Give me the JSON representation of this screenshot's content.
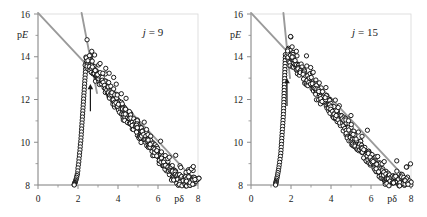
{
  "figure": {
    "title": "",
    "panels": [
      {
        "id": "left",
        "tag_var": "j",
        "tag_eq": "=",
        "tag_val": "9",
        "tag_full": "j = 9"
      },
      {
        "id": "right",
        "tag_var": "j",
        "tag_eq": "=",
        "tag_val": "15",
        "tag_full": "j = 15"
      }
    ]
  },
  "axes": {
    "x_label_p": "p",
    "x_label_sym": "δ",
    "y_label_p": "p",
    "y_label_sym": "E",
    "x_ticks": [
      "0",
      "2",
      "4",
      "6",
      "8"
    ],
    "y_ticks": [
      "8",
      "10",
      "12",
      "14",
      "16"
    ],
    "x_minor_count": 1,
    "y_minor_count": 1
  },
  "style": {
    "marker_edge": "#111111",
    "marker_face": "#ffffff",
    "line_color": "#9a9a9a",
    "axis_color": "#8c8c8c",
    "arrow_color": "#1a1a1a",
    "text_color": "#1a1a1a"
  },
  "chart_data": [
    {
      "type": "scatter",
      "panel": "left",
      "title": "j = 9",
      "xlabel": "pδ",
      "ylabel": "pE",
      "xlim": [
        0,
        8
      ],
      "ylim": [
        8,
        16
      ],
      "xticks": [
        0,
        2,
        4,
        6,
        8
      ],
      "yticks": [
        8,
        10,
        12,
        14,
        16
      ],
      "grid": false,
      "legend": false,
      "marker": "open-circle",
      "annotations": [
        {
          "kind": "text",
          "text": "j = 9",
          "x": 5.75,
          "y": 14.95
        },
        {
          "kind": "arrow",
          "x": 2.62,
          "y_tail": 11.45,
          "y_head": 12.72,
          "direction": "up"
        }
      ],
      "lines": [
        {
          "name": "shallow-guide",
          "x": [
            0.0,
            8.0
          ],
          "y": [
            16.05,
            8.05
          ]
        },
        {
          "name": "steep-guide",
          "x": [
            2.18,
            2.95
          ],
          "y": [
            16.05,
            12.3
          ]
        }
      ],
      "series": [
        {
          "name": "vertical-branch",
          "x": [
            2.4,
            2.39,
            2.38,
            2.37,
            2.36,
            2.35,
            2.34,
            2.33,
            2.32,
            2.31,
            2.3,
            2.29,
            2.28,
            2.27,
            2.26,
            2.25,
            2.24,
            2.23,
            2.22,
            2.21,
            2.2,
            2.19,
            2.18,
            2.17,
            2.16,
            2.15,
            2.14,
            2.12,
            2.11,
            2.1,
            2.08,
            2.07,
            2.05,
            2.04,
            2.02,
            2.0,
            1.99,
            1.97,
            1.95,
            1.93,
            1.91,
            1.89,
            1.87,
            1.85,
            1.84,
            1.83,
            1.82,
            1.81,
            1.81
          ],
          "y": [
            13.7,
            13.56,
            13.42,
            13.28,
            13.14,
            13.0,
            12.86,
            12.72,
            12.58,
            12.44,
            12.3,
            12.16,
            12.02,
            11.88,
            11.74,
            11.6,
            11.46,
            11.32,
            11.18,
            11.04,
            10.9,
            10.76,
            10.62,
            10.48,
            10.34,
            10.2,
            10.06,
            9.92,
            9.78,
            9.64,
            9.5,
            9.36,
            9.22,
            9.08,
            8.94,
            8.8,
            8.66,
            8.52,
            8.44,
            8.36,
            8.28,
            8.22,
            8.16,
            8.12,
            8.09,
            8.06,
            8.04,
            8.02,
            8.0
          ]
        },
        {
          "name": "diagonal-band",
          "x": [
            2.45,
            2.5,
            2.55,
            2.58,
            2.62,
            2.66,
            2.7,
            2.74,
            2.78,
            2.82,
            2.86,
            2.9,
            2.95,
            3.0,
            3.05,
            3.1,
            3.15,
            3.2,
            3.25,
            3.3,
            3.35,
            3.4,
            3.45,
            3.5,
            3.55,
            3.6,
            3.65,
            3.7,
            3.75,
            3.8,
            3.85,
            3.9,
            3.95,
            4.0,
            4.05,
            4.1,
            4.15,
            4.2,
            4.25,
            4.3,
            4.35,
            4.4,
            4.45,
            4.5,
            4.55,
            4.6,
            4.65,
            4.7,
            4.75,
            4.8,
            4.85,
            4.9,
            4.95,
            5.0,
            5.05,
            5.1,
            5.15,
            5.2,
            5.25,
            5.3,
            5.35,
            5.4,
            5.45,
            5.5,
            5.55,
            5.6,
            5.65,
            5.7,
            5.75,
            5.8,
            5.85,
            5.9,
            5.95,
            6.0,
            6.05,
            6.1,
            6.15,
            6.2,
            6.25,
            6.3,
            6.35,
            6.4,
            6.45,
            6.5,
            6.55,
            6.6,
            6.65,
            6.7,
            6.75,
            6.8,
            6.85,
            6.9,
            6.95,
            7.0,
            7.05,
            7.1,
            7.15,
            7.2,
            7.25,
            7.3,
            7.35,
            7.4,
            7.45,
            7.5,
            7.55,
            7.6,
            7.65,
            7.7,
            7.75,
            7.8,
            7.85,
            7.9,
            7.95
          ],
          "y": [
            13.72,
            13.64,
            13.58,
            13.52,
            13.46,
            13.4,
            13.34,
            13.28,
            13.22,
            13.16,
            13.1,
            13.04,
            12.98,
            12.92,
            12.86,
            12.8,
            12.74,
            12.68,
            12.62,
            12.56,
            12.5,
            12.44,
            12.38,
            12.32,
            12.26,
            12.2,
            12.14,
            12.08,
            12.02,
            11.96,
            11.9,
            11.84,
            11.78,
            11.72,
            11.66,
            11.6,
            11.54,
            11.48,
            11.42,
            11.36,
            11.3,
            11.24,
            11.18,
            11.12,
            11.06,
            11.0,
            10.94,
            10.88,
            10.82,
            10.76,
            10.7,
            10.64,
            10.58,
            10.52,
            10.46,
            10.4,
            10.34,
            10.28,
            10.22,
            10.16,
            10.1,
            10.04,
            9.98,
            9.92,
            9.86,
            9.8,
            9.74,
            9.68,
            9.62,
            9.56,
            9.5,
            9.44,
            9.38,
            9.32,
            9.26,
            9.2,
            9.14,
            9.08,
            9.02,
            8.96,
            8.9,
            8.84,
            8.78,
            8.72,
            8.66,
            8.6,
            8.54,
            8.48,
            8.42,
            8.36,
            8.3,
            8.26,
            8.22,
            8.18,
            8.14,
            8.12,
            8.1,
            8.08,
            8.06,
            8.05,
            8.04,
            8.04,
            8.03,
            8.03,
            8.02,
            8.02,
            8.02,
            8.01,
            8.01,
            8.01,
            8.0,
            8.0,
            8.0
          ]
        }
      ]
    },
    {
      "type": "scatter",
      "panel": "right",
      "title": "j = 15",
      "xlabel": "pδ",
      "ylabel": "pE",
      "xlim": [
        0,
        8
      ],
      "ylim": [
        8,
        16
      ],
      "xticks": [
        0,
        2,
        4,
        6,
        8
      ],
      "yticks": [
        8,
        10,
        12,
        14,
        16
      ],
      "grid": false,
      "legend": false,
      "marker": "open-circle",
      "annotations": [
        {
          "kind": "text",
          "text": "j = 15",
          "x": 5.7,
          "y": 14.95
        },
        {
          "kind": "arrow",
          "x": 1.8,
          "y_tail": 11.7,
          "y_head": 13.0,
          "direction": "up"
        }
      ],
      "lines": [
        {
          "name": "shallow-guide",
          "x": [
            0.0,
            8.0
          ],
          "y": [
            16.05,
            8.05
          ]
        },
        {
          "name": "steep-guide",
          "x": [
            1.62,
            1.95
          ],
          "y": [
            16.05,
            13.0
          ]
        }
      ],
      "series": [
        {
          "name": "vertical-branch",
          "x": [
            1.72,
            1.715,
            1.71,
            1.705,
            1.7,
            1.695,
            1.69,
            1.685,
            1.68,
            1.675,
            1.67,
            1.665,
            1.66,
            1.655,
            1.65,
            1.645,
            1.64,
            1.635,
            1.63,
            1.625,
            1.62,
            1.61,
            1.6,
            1.59,
            1.58,
            1.57,
            1.56,
            1.55,
            1.54,
            1.53,
            1.52,
            1.51,
            1.5,
            1.49,
            1.47,
            1.45,
            1.43,
            1.41,
            1.39,
            1.37,
            1.35,
            1.33,
            1.31,
            1.29,
            1.27,
            1.26,
            1.25,
            1.24,
            1.235,
            1.23
          ],
          "y": [
            14.1,
            13.96,
            13.82,
            13.68,
            13.54,
            13.4,
            13.26,
            13.12,
            12.98,
            12.84,
            12.7,
            12.56,
            12.42,
            12.28,
            12.14,
            12.0,
            11.86,
            11.72,
            11.58,
            11.44,
            11.3,
            11.16,
            11.02,
            10.88,
            10.74,
            10.6,
            10.46,
            10.32,
            10.18,
            10.04,
            9.9,
            9.76,
            9.62,
            9.48,
            9.34,
            9.2,
            9.06,
            8.92,
            8.8,
            8.68,
            8.58,
            8.48,
            8.38,
            8.3,
            8.22,
            8.16,
            8.12,
            8.08,
            8.04,
            8.0
          ]
        },
        {
          "name": "diagonal-band",
          "x": [
            1.8,
            1.85,
            1.9,
            1.95,
            2.0,
            2.05,
            2.1,
            2.15,
            2.2,
            2.25,
            2.3,
            2.35,
            2.4,
            2.45,
            2.5,
            2.55,
            2.6,
            2.65,
            2.7,
            2.75,
            2.8,
            2.85,
            2.9,
            2.95,
            3.0,
            3.05,
            3.1,
            3.15,
            3.2,
            3.25,
            3.3,
            3.35,
            3.4,
            3.45,
            3.5,
            3.55,
            3.6,
            3.65,
            3.7,
            3.75,
            3.8,
            3.85,
            3.9,
            3.95,
            4.0,
            4.05,
            4.1,
            4.15,
            4.2,
            4.25,
            4.3,
            4.35,
            4.4,
            4.45,
            4.5,
            4.55,
            4.6,
            4.65,
            4.7,
            4.75,
            4.8,
            4.85,
            4.9,
            4.95,
            5.0,
            5.05,
            5.1,
            5.15,
            5.2,
            5.25,
            5.3,
            5.35,
            5.4,
            5.45,
            5.5,
            5.55,
            5.6,
            5.65,
            5.7,
            5.75,
            5.8,
            5.85,
            5.9,
            5.95,
            6.0,
            6.05,
            6.1,
            6.15,
            6.2,
            6.25,
            6.3,
            6.35,
            6.4,
            6.45,
            6.5,
            6.55,
            6.6,
            6.65,
            6.7,
            6.75,
            6.8,
            6.85,
            6.9,
            6.95,
            7.0,
            7.05,
            7.1,
            7.15,
            7.2,
            7.25,
            7.3,
            7.35,
            7.4,
            7.45,
            7.5,
            7.55,
            7.6,
            7.65,
            7.7,
            7.75,
            7.8,
            7.85,
            7.9,
            7.95
          ],
          "y": [
            14.1,
            14.04,
            13.98,
            13.92,
            13.86,
            13.8,
            13.74,
            13.68,
            13.62,
            13.56,
            13.5,
            13.44,
            13.38,
            13.32,
            13.26,
            13.2,
            13.14,
            13.08,
            13.02,
            12.96,
            12.9,
            12.84,
            12.78,
            12.72,
            12.66,
            12.6,
            12.54,
            12.48,
            12.42,
            12.36,
            12.3,
            12.24,
            12.18,
            12.12,
            12.06,
            12.0,
            11.94,
            11.88,
            11.82,
            11.76,
            11.7,
            11.64,
            11.58,
            11.52,
            11.46,
            11.4,
            11.34,
            11.28,
            11.22,
            11.16,
            11.1,
            11.04,
            10.98,
            10.92,
            10.86,
            10.8,
            10.74,
            10.68,
            10.62,
            10.56,
            10.5,
            10.44,
            10.38,
            10.32,
            10.26,
            10.2,
            10.14,
            10.08,
            10.02,
            9.96,
            9.9,
            9.84,
            9.78,
            9.72,
            9.66,
            9.6,
            9.54,
            9.48,
            9.42,
            9.36,
            9.3,
            9.24,
            9.18,
            9.12,
            9.06,
            9.0,
            8.94,
            8.88,
            8.82,
            8.76,
            8.7,
            8.64,
            8.58,
            8.52,
            8.46,
            8.4,
            8.36,
            8.32,
            8.28,
            8.24,
            8.2,
            8.17,
            8.14,
            8.12,
            8.1,
            8.08,
            8.07,
            8.06,
            8.05,
            8.04,
            8.04,
            8.03,
            8.03,
            8.02,
            8.02,
            8.02,
            8.01,
            8.01,
            8.01,
            8.0,
            8.0,
            8.0,
            8.0,
            8.0
          ]
        }
      ]
    }
  ]
}
